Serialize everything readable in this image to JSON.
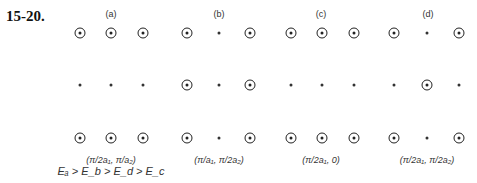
{
  "problem_number": "15-20.",
  "panels": [
    {
      "label": "(a)",
      "label_x": 111,
      "caption": "(π/2a₁, π/a₂)",
      "caption2": "Eₐ > E_b > E_d > E_c",
      "caption_x": 111,
      "columns_x": [
        80,
        111,
        143
      ],
      "rows": [
        [
          "ring",
          "ring",
          "ring"
        ],
        [
          "dot",
          "dot",
          "dot"
        ],
        [
          "ring",
          "ring",
          "ring"
        ]
      ]
    },
    {
      "label": "(b)",
      "label_x": 219,
      "caption": "(π/a₁, π/2a₂)",
      "caption2": "",
      "caption_x": 219,
      "columns_x": [
        187,
        219,
        250
      ],
      "rows": [
        [
          "ring",
          "dot",
          "ring"
        ],
        [
          "ring",
          "dot",
          "ring"
        ],
        [
          "ring",
          "dot",
          "ring"
        ]
      ]
    },
    {
      "label": "(c)",
      "label_x": 321,
      "caption": "(π/2a₁, 0)",
      "caption2": "",
      "caption_x": 321,
      "columns_x": [
        291,
        322,
        354
      ],
      "rows": [
        [
          "ring",
          "ring",
          "ring"
        ],
        [
          "dot",
          "dot",
          "dot"
        ],
        [
          "ring",
          "ring",
          "ring"
        ]
      ]
    },
    {
      "label": "(d)",
      "label_x": 428,
      "caption": "(π/2a₁, π/2a₂)",
      "caption2": "",
      "caption_x": 427,
      "columns_x": [
        394,
        427,
        459
      ],
      "rows": [
        [
          "ring",
          "dot",
          "ring"
        ],
        [
          "dot",
          "ring",
          "dot"
        ],
        [
          "ring",
          "dot",
          "ring"
        ]
      ]
    }
  ],
  "rows_y": [
    33,
    85,
    138
  ]
}
